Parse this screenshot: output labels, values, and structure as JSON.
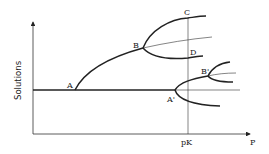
{
  "diagram": {
    "type": "bifurcation-diagram",
    "y_axis_label": "Solutions",
    "x_axis_label": "P",
    "critical_value_label": "pK",
    "points": {
      "A": "A",
      "B": "B",
      "C": "C",
      "D": "D",
      "A_prime": "A'",
      "B_prime": "B'"
    }
  }
}
